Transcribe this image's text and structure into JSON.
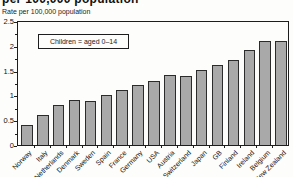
{
  "header": {
    "clipped_title": "per 100,000 population"
  },
  "chart_data": {
    "type": "bar",
    "ylabel": "Rate per 100,000 population",
    "legend": "Children = aged 0–14",
    "categories": [
      "Norway",
      "Italy",
      "Netherlands",
      "Denmark",
      "Sweden",
      "Spain",
      "France",
      "Germany",
      "USA",
      "Austria",
      "Switzerland",
      "Japan",
      "GB",
      "Finland",
      "Ireland",
      "Belgium",
      "New Zealand"
    ],
    "values": [
      0.4,
      0.61,
      0.82,
      0.91,
      0.89,
      1.02,
      1.12,
      1.22,
      1.31,
      1.43,
      1.41,
      1.53,
      1.63,
      1.73,
      1.93,
      2.12,
      2.11
    ],
    "ylim": [
      0,
      2.5
    ],
    "ytick_labels": [
      "0",
      "0.5",
      "1",
      "1.5",
      "2",
      "2.5"
    ],
    "yticks": [
      0,
      0.5,
      1,
      1.5,
      2,
      2.5
    ],
    "minor_tick_step": 0.25,
    "grid": false,
    "legend_position": "top-left-inside",
    "bar_color": "#a9a9a9",
    "bar_border_color": "#2b2b2b"
  }
}
